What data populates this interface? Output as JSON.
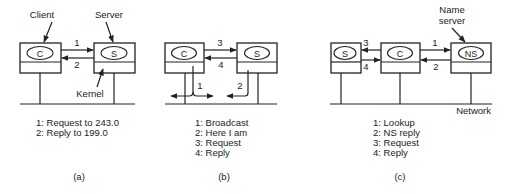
{
  "panels": [
    {
      "id": "a",
      "caption": "(a)",
      "annotations": {
        "client": "Client",
        "server": "Server",
        "kernel": "Kernel"
      },
      "machines": [
        {
          "label": "C"
        },
        {
          "label": "S"
        }
      ],
      "arrows": [
        {
          "num": "1"
        },
        {
          "num": "2"
        }
      ],
      "legend": [
        "1: Request to 243.0",
        "2: Reply to 199.0"
      ]
    },
    {
      "id": "b",
      "caption": "(b)",
      "machines": [
        {
          "label": "C"
        },
        {
          "label": "S"
        }
      ],
      "arrows": [
        {
          "num": "1"
        },
        {
          "num": "2"
        },
        {
          "num": "3"
        },
        {
          "num": "4"
        }
      ],
      "legend": [
        "1: Broadcast",
        "2: Here I am",
        "3: Request",
        "4: Reply"
      ]
    },
    {
      "id": "c",
      "caption": "(c)",
      "annotations": {
        "name_server_line1": "Name",
        "name_server_line2": "server",
        "network": "Network"
      },
      "machines": [
        {
          "label": "S"
        },
        {
          "label": "C"
        },
        {
          "label": "NS"
        }
      ],
      "arrows": [
        {
          "num": "1"
        },
        {
          "num": "2"
        },
        {
          "num": "3"
        },
        {
          "num": "4"
        }
      ],
      "legend": [
        "1: Lookup",
        "2: NS reply",
        "3: Request",
        "4: Reply"
      ]
    }
  ]
}
